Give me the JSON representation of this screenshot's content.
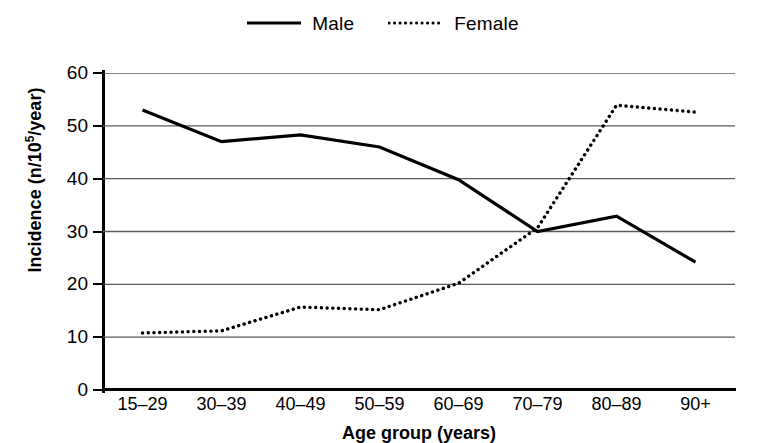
{
  "legend": {
    "position": "top-center",
    "items": [
      {
        "label": "Male",
        "style": "solid",
        "icon": "solid-line-swatch"
      },
      {
        "label": "Female",
        "style": "dotted",
        "icon": "dotted-line-swatch"
      }
    ]
  },
  "axes": {
    "y": {
      "title_main": "Incidence (n/10",
      "title_sup": "5",
      "title_tail": "/year)",
      "ticks": [
        "60",
        "50",
        "40",
        "30",
        "20",
        "10",
        "0"
      ]
    },
    "x": {
      "title": "Age group (years)",
      "ticks": [
        "15–29",
        "30–39",
        "40–49",
        "50–59",
        "60–69",
        "70–79",
        "80–89",
        "90+"
      ]
    }
  },
  "chart_data": {
    "type": "line",
    "title": "",
    "subtitle": "",
    "xlabel": "Age group (years)",
    "ylabel": "Incidence (n/10^5/year)",
    "categories": [
      "15–29",
      "30–39",
      "40–49",
      "50–59",
      "60–69",
      "70–79",
      "80–89",
      "90+"
    ],
    "series": [
      {
        "name": "Male",
        "style": "solid",
        "color": "#000000",
        "values": [
          53.0,
          47.0,
          48.3,
          46.0,
          39.8,
          30.0,
          32.9,
          24.2
        ]
      },
      {
        "name": "Female",
        "style": "dotted",
        "color": "#000000",
        "values": [
          10.8,
          11.2,
          15.7,
          15.2,
          20.2,
          30.7,
          53.9,
          52.6
        ]
      }
    ],
    "ylim": [
      0,
      60
    ],
    "ytick_values": [
      0,
      10,
      20,
      30,
      40,
      50,
      60
    ],
    "grid": "horizontal",
    "legend_position": "top-center"
  },
  "colors": {
    "ink": "#000000",
    "grid": "#5a5a5a",
    "background": "#ffffff"
  }
}
